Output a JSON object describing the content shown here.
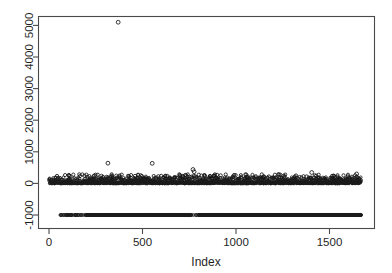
{
  "chart_data": {
    "type": "scatter",
    "title": "",
    "subtitle": "",
    "xlabel": "Index",
    "ylabel": "",
    "xlim": [
      -40,
      1730
    ],
    "ylim": [
      -1300,
      5400
    ],
    "xticks": [
      0,
      500,
      1000,
      1500
    ],
    "xticklabels": [
      "0",
      "500",
      "1000",
      "1500"
    ],
    "yticks": [
      -1000,
      0,
      1000,
      2000,
      3000,
      4000,
      5000
    ],
    "yticklabels": [
      "-1000",
      "0",
      "1000",
      "2000",
      "3000",
      "4000",
      "5000"
    ],
    "grid": false,
    "legend": null,
    "point_marker": "open-circle",
    "point_color": "#141414",
    "series": [
      {
        "name": "values",
        "note": "Bulk of observations lie in a dense band from about 0 to 200; a censored/missing-value group sits exactly at -1000; one extreme outlier near index 370 reaches about 5100.",
        "outliers": [
          {
            "index": 370,
            "value": 5100
          },
          {
            "index": 315,
            "value": 640
          },
          {
            "index": 552,
            "value": 635
          },
          {
            "index": 770,
            "value": 440
          },
          {
            "index": 776,
            "value": 370
          },
          {
            "index": 1405,
            "value": 345
          },
          {
            "index": 1645,
            "value": 300
          },
          {
            "index": 243,
            "value": 240
          },
          {
            "index": 1148,
            "value": 215
          },
          {
            "index": 1530,
            "value": 185
          }
        ],
        "censored_value": -1000,
        "band_min": 0,
        "band_max": 200,
        "n_points": 1670
      }
    ]
  },
  "axes": {
    "x_axis_label": "Index",
    "y_axis_label": ""
  },
  "figure": {
    "background_color": "#ffffff",
    "frame_color": "#4a4a4a",
    "text_color": "#1f1f1f"
  }
}
